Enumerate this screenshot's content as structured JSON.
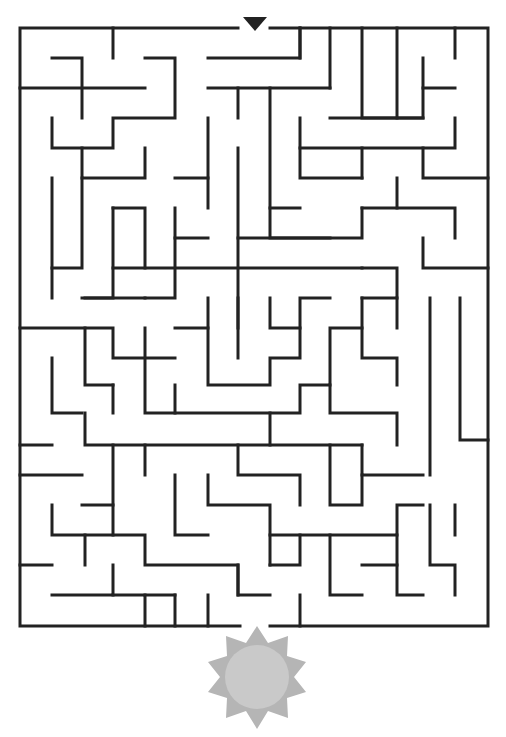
{
  "puzzle": {
    "type": "maze",
    "start_marker": "down-triangle-icon",
    "goal_icon": "sun-icon",
    "colors": {
      "wall": "#222222",
      "sun_rays": "#b5b5b5",
      "sun_disc": "#c9c9c9",
      "background": "#ffffff"
    }
  }
}
